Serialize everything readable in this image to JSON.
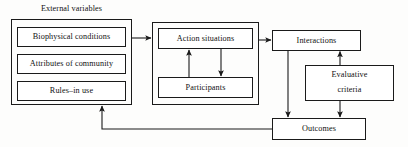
{
  "diagram": {
    "title": "External variables",
    "colors": {
      "stroke": "#1a1a1a",
      "box_fill": "#ffffff",
      "background": "#fdfdfc",
      "text": "#111111"
    },
    "external_variables": {
      "label": "External variables",
      "items": [
        {
          "label": "Biophysical conditions"
        },
        {
          "label": "Attributes of community"
        },
        {
          "label": "Rules–in use"
        }
      ]
    },
    "action_arena": {
      "items": [
        {
          "label": "Action situations"
        },
        {
          "label": "Participants"
        }
      ]
    },
    "interactions": {
      "label": "Interactions"
    },
    "evaluative_criteria": {
      "label": "Evaluative\ncriteria",
      "line1": "Evaluative",
      "line2": "criteria"
    },
    "outcomes": {
      "label": "Outcomes"
    },
    "arrows": [
      {
        "name": "external-to-action-arena",
        "from": "External variables",
        "to": "Action situations"
      },
      {
        "name": "action-situations-to-participants",
        "from": "Action situations",
        "to": "Participants"
      },
      {
        "name": "participants-to-action-situations",
        "from": "Participants",
        "to": "Action situations"
      },
      {
        "name": "action-arena-to-interactions",
        "from": "Action situations",
        "to": "Interactions"
      },
      {
        "name": "interactions-to-outcomes",
        "from": "Interactions",
        "to": "Outcomes"
      },
      {
        "name": "evaluative-criteria-to-interactions",
        "from": "Evaluative criteria",
        "to": "Interactions"
      },
      {
        "name": "evaluative-criteria-to-outcomes",
        "from": "Evaluative criteria",
        "to": "Outcomes"
      },
      {
        "name": "outcomes-feedback-to-external",
        "from": "Outcomes",
        "to": "External variables"
      }
    ]
  }
}
